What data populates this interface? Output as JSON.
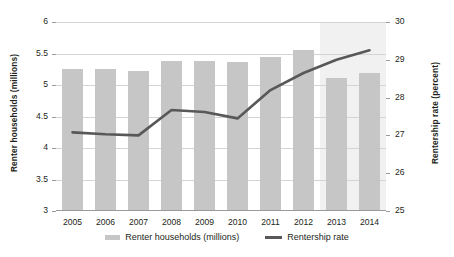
{
  "chart_data": {
    "type": "bar",
    "title": "",
    "subtitle": "",
    "xlabel": "",
    "ylabel": "Renter households (millions)",
    "y2label": "Rentership rate (percent)",
    "categories": [
      "2005",
      "2006",
      "2007",
      "2008",
      "2009",
      "2010",
      "2011",
      "2012",
      "2013",
      "2014"
    ],
    "ylim": [
      3,
      6
    ],
    "y_ticks": [
      "3",
      "3.5",
      "4",
      "4.5",
      "5",
      "5.5",
      "6"
    ],
    "y2lim": [
      25,
      30
    ],
    "y2_ticks": [
      "25",
      "26",
      "27",
      "28",
      "29",
      "30"
    ],
    "grid": true,
    "legend_position": "bottom",
    "shaded_region": {
      "label": "",
      "start_category": "2013",
      "end_category": "2014",
      "color": "#f1f1f1"
    },
    "series": [
      {
        "name": "Renter households (millions)",
        "type": "bar",
        "axis": "left",
        "color": "#c6c6c6",
        "values": [
          5.25,
          5.25,
          5.22,
          5.38,
          5.38,
          5.36,
          5.45,
          5.55,
          5.11,
          5.19
        ]
      },
      {
        "name": "Rentership rate",
        "type": "line",
        "axis": "right",
        "color": "#58585a",
        "values": [
          27.08,
          27.03,
          27.0,
          27.67,
          27.62,
          27.45,
          28.2,
          28.65,
          29.0,
          29.25
        ]
      }
    ]
  },
  "legend": {
    "items": [
      {
        "label": "Renter households (millions)",
        "marker": "bar-swatch"
      },
      {
        "label": "Rentership rate",
        "marker": "line-swatch"
      }
    ]
  }
}
